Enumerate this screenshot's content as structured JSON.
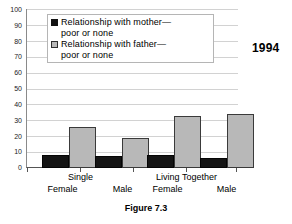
{
  "year_label": "1994",
  "caption": "Figure 7.3",
  "legend": {
    "items": [
      {
        "marker": "filled-black-square",
        "line1": "Relationship  with  mother—",
        "line2": "poor  or  none"
      },
      {
        "marker": "light-gray-square",
        "line1": "Relationship  with  father—",
        "line2": "poor  or  none"
      }
    ]
  },
  "chart_data": {
    "type": "bar",
    "title": "Figure 7.3",
    "subtitle": "1994",
    "xlabel": "",
    "ylabel": "",
    "ylim": [
      0,
      100
    ],
    "yticks": [
      0,
      10,
      20,
      30,
      40,
      50,
      60,
      70,
      80,
      90,
      100
    ],
    "ytick_labels": [
      "0",
      "10",
      "20",
      "30",
      "40",
      "50",
      "60",
      "70",
      "80",
      "90",
      "100"
    ],
    "grid": true,
    "legend_position": "upper-center",
    "group_labels": [
      "Single",
      "Living Together"
    ],
    "categories": [
      "Female",
      "Male",
      "Female",
      "Male"
    ],
    "series": [
      {
        "name": "Relationship with mother—poor or none",
        "color": "#151515",
        "values": [
          8,
          7.5,
          8,
          6.5
        ]
      },
      {
        "name": "Relationship with father—poor or none",
        "color": "#b8b8b8",
        "values": [
          26,
          19,
          33,
          34
        ]
      }
    ]
  }
}
